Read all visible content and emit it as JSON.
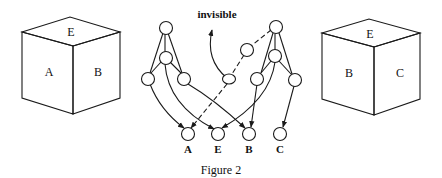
{
  "figure": {
    "caption": "Figure 2",
    "annotation": "invisible"
  },
  "left_cube": {
    "faces": {
      "top": "E",
      "left": "A",
      "right": "B"
    }
  },
  "right_cube": {
    "faces": {
      "top": "E",
      "left": "B",
      "right": "C"
    }
  },
  "network": {
    "output_labels": [
      "A",
      "E",
      "B",
      "C"
    ],
    "left_tree": {
      "description": "Hierarchy for left cube (A, E, B visible)"
    },
    "right_tree": {
      "description": "Hierarchy for right cube (E, B, C visible); dashed path to A is invisible"
    }
  },
  "colors": {
    "ink": "#1a1a1a",
    "background": "#ffffff"
  }
}
